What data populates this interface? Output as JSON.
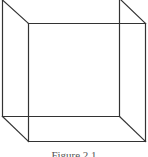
{
  "figure": {
    "type": "wireframe-cube",
    "caption": "Figure 2.1",
    "stroke_color": "#333333",
    "back_square": {
      "x1": 2,
      "y1": 0,
      "x2": 119,
      "y2": 116
    },
    "front_square": {
      "x1": 28,
      "y1": 23,
      "x2": 145,
      "y2": 141
    },
    "edges": [
      {
        "name": "top-left-diagonal",
        "from": [
          2,
          0
        ],
        "to": [
          28,
          23
        ]
      },
      {
        "name": "top-right-diagonal",
        "from": [
          121,
          0
        ],
        "to": [
          145,
          23
        ]
      },
      {
        "name": "bottom-left-diagonal",
        "from": [
          2,
          116
        ],
        "to": [
          28,
          141
        ]
      },
      {
        "name": "bottom-right-diagonal",
        "from": [
          119,
          116
        ],
        "to": [
          145,
          141
        ]
      }
    ]
  }
}
